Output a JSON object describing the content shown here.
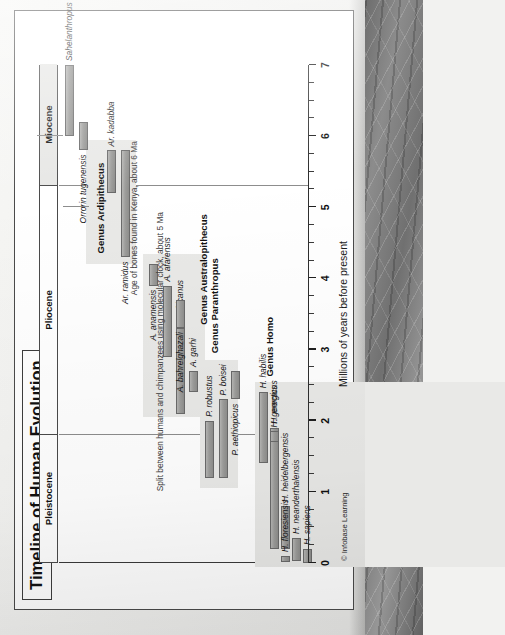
{
  "figure": {
    "title": "Timeline of Human Evolution",
    "credit": "© Infobase Learning"
  },
  "notes": [
    {
      "text": "Split between humans and chimpanzees using molecular clock, about 5 Ma"
    },
    {
      "text": "Age of bones found in Kenya, about 6 Ma"
    }
  ],
  "epochs": [
    {
      "label": "Pleistocene",
      "start": 0.0,
      "end": 1.8
    },
    {
      "label": "Pliocene",
      "start": 1.8,
      "end": 5.3
    },
    {
      "label": "Miocene",
      "start": 5.3,
      "end": 7.0
    }
  ],
  "groups": [
    {
      "label": "Genus Homo"
    },
    {
      "label": "Genus Paranthropus"
    },
    {
      "label": "Genus Australopithecus"
    },
    {
      "label": "Genus Ardipithecus"
    }
  ],
  "chart_data": {
    "type": "bar",
    "title": "Timeline of Human Evolution",
    "xlabel": "Millions of years before present",
    "ylabel": "",
    "xlim": [
      0,
      7
    ],
    "xticks": [
      0,
      1,
      2,
      3,
      4,
      5,
      6,
      7
    ],
    "xtick_labels": [
      "0",
      "1",
      "2",
      "3",
      "4",
      "5",
      "6",
      "7"
    ],
    "minor_tick_step": 0.25,
    "grid": false,
    "legend": "none",
    "orientation": "horizontal-ranges",
    "units": "Ma (millions of years before present)",
    "groups": [
      {
        "name": "Genus Homo",
        "species": [
          {
            "name": "H. sapiens",
            "start": 0.0,
            "end": 0.2
          },
          {
            "name": "H. neanderthalensis",
            "start": 0.03,
            "end": 0.35
          },
          {
            "name": "H. heidelbergensis",
            "start": 0.2,
            "end": 0.8
          },
          {
            "name": "H. floresiensis",
            "start": 0.01,
            "end": 0.1
          },
          {
            "name": "H. erectus",
            "start": 0.2,
            "end": 1.9
          },
          {
            "name": "H. georgicus",
            "start": 1.7,
            "end": 1.85
          },
          {
            "name": "H. habilis",
            "start": 1.4,
            "end": 2.4
          }
        ]
      },
      {
        "name": "Genus Paranthropus",
        "species": [
          {
            "name": "P. robustus",
            "start": 1.2,
            "end": 2.0
          },
          {
            "name": "P. boisei",
            "start": 1.2,
            "end": 2.3
          },
          {
            "name": "P. aethiopicus",
            "start": 2.3,
            "end": 2.7
          }
        ]
      },
      {
        "name": "Genus Australopithecus",
        "species": [
          {
            "name": "A. garhi",
            "start": 2.4,
            "end": 2.7
          },
          {
            "name": "A. africanus",
            "start": 2.1,
            "end": 3.3
          },
          {
            "name": "A. bahrelghazali",
            "start": 3.3,
            "end": 3.7
          },
          {
            "name": "A. afarensis",
            "start": 2.9,
            "end": 3.9
          },
          {
            "name": "A. anamensis",
            "start": 3.9,
            "end": 4.2
          }
        ]
      },
      {
        "name": "Genus Ardipithecus",
        "species": [
          {
            "name": "Ar. ramidus",
            "start": 4.3,
            "end": 5.8
          },
          {
            "name": "Ar. kadabba",
            "start": 5.2,
            "end": 5.8
          }
        ]
      },
      {
        "name": "Earliest hominins",
        "species": [
          {
            "name": "Orrorin tugenensis",
            "start": 5.8,
            "end": 6.2
          },
          {
            "name": "Sahelanthropus tchadensis",
            "start": 6.0,
            "end": 7.0
          }
        ]
      }
    ],
    "annotations": [
      {
        "text": "Split between humans and chimpanzees using molecular clock, about 5 Ma",
        "at": 5.0
      },
      {
        "text": "Age of bones found in Kenya, about 6 Ma",
        "at": 6.0
      }
    ]
  }
}
